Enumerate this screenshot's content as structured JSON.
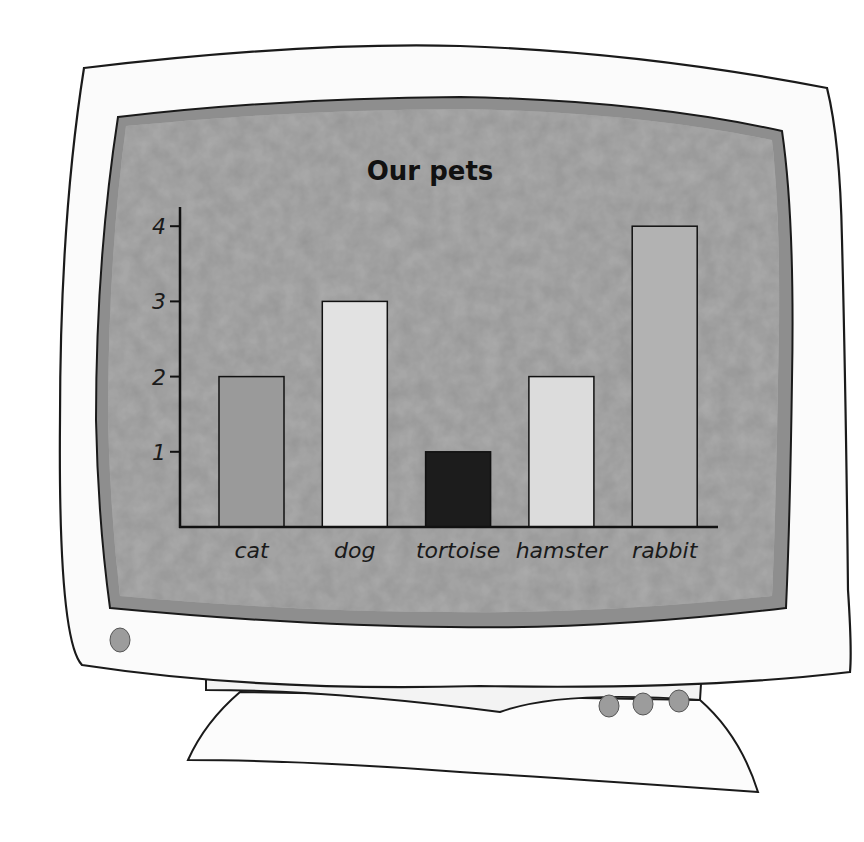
{
  "chart_data": {
    "type": "bar",
    "title": "Our pets",
    "xlabel": "",
    "ylabel": "",
    "categories": [
      "cat",
      "dog",
      "tortoise",
      "hamster",
      "rabbit"
    ],
    "values": [
      2,
      3,
      1,
      2,
      4
    ],
    "yticks": [
      "1",
      "2",
      "3",
      "4"
    ],
    "ylim": [
      0,
      4
    ],
    "grid": false,
    "legend": null,
    "bar_colors": [
      "#9a9a9a",
      "#e2e2e2",
      "#1c1c1c",
      "#dcdcdc",
      "#b2b2b2"
    ]
  },
  "colors": {
    "bezel": "#fbfbfb",
    "screen_rim": "#8e8e8e",
    "screen": "#a9a9a9",
    "outline": "#1a1a1a",
    "button": "#9c9c9c"
  },
  "monitor": {
    "power_button": "power-button",
    "stand_buttons": 3
  }
}
